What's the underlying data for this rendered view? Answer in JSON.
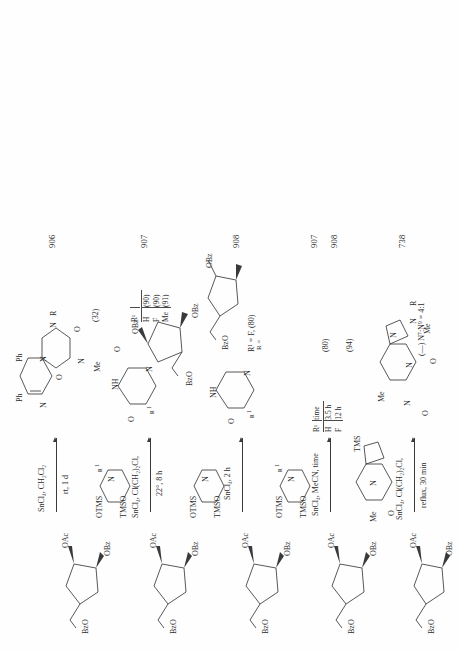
{
  "page": {
    "kind": "chemical-reaction-scheme",
    "orientation": "rotated-90-ccw",
    "background": "#fefefe",
    "ink": "#2b2b2b"
  },
  "rows": [
    {
      "id": "row-1",
      "substrate_label": "BzO — sugar — OAc (3,5-di-O-benzoyl-2-deoxyribofuranosyl acetate)",
      "reagent": "TMSO / Me-N pyrimido[4,5-b]pyrazine-2,4-dione, 6,7-diphenyl",
      "conditions_line1": "SnCl₄, CH₂Cl₂",
      "conditions_line2": "rt, 1 d",
      "yield": "(32)",
      "product_number": "906",
      "product_atoms": [
        "Ph",
        "Ph",
        "N",
        "N",
        "O",
        "O",
        "N",
        "N",
        "Me",
        "R"
      ]
    },
    {
      "id": "row-2",
      "substrate_label": "BzO — sugar — OAc",
      "reagent": "OTMS / TMSO pyrimidine with R¹",
      "conditions_line1": "SnCl₄, Cl(CH₂)₂Cl,",
      "conditions_line2": "22°, 8 h",
      "product_number": "907",
      "table": {
        "headers": [
          "R¹",
          ""
        ],
        "rows": [
          [
            "H",
            "(90)"
          ],
          [
            "F",
            "(90)"
          ],
          [
            "Me",
            "(91)"
          ]
        ]
      },
      "product_atoms": [
        "O",
        "NH",
        "O",
        "N",
        "R¹",
        "OBz",
        "OBz",
        "BzO"
      ]
    },
    {
      "id": "row-3",
      "substrate_label": "BzO — sugar — OAc",
      "reagent": "OTMS / TMSO pyrimidine",
      "conditions_line1": "SnCl₄, 2 h",
      "yield": "R¹ = F, (80)",
      "product_number": "908",
      "r_definition": "R =",
      "product_atoms": [
        "O",
        "NH",
        "O",
        "N",
        "R¹",
        "BzO",
        "OBz"
      ]
    },
    {
      "id": "row-4",
      "substrate_label": "BzO — sugar — OAc",
      "reagent": "OTMS / TMSO pyrimidine with R¹",
      "conditions_line1": "SnCl₄, MeCN, time",
      "table": {
        "headers": [
          "R¹",
          "time"
        ],
        "rows": [
          [
            "H",
            "3.5 h",
            "(80)"
          ],
          [
            "F",
            "12 h",
            "(94)"
          ]
        ]
      },
      "product_numbers": [
        "907",
        "908"
      ],
      "yields": [
        "(80)",
        "(94)"
      ]
    },
    {
      "id": "row-5",
      "substrate_label": "BzO — sugar — OAc",
      "reagent": "Me-N imidazo-fused purine-dione, TMS",
      "conditions_line1": "SnCl₄, Cl(CH₂)₂Cl,",
      "conditions_line2": "reflux, 30 min",
      "yield": "(—) N⁷:N⁹ = 4:1",
      "product_number": "738",
      "product_atoms": [
        "Me",
        "N",
        "N",
        "O",
        "O",
        "N",
        "Me",
        "R",
        "N",
        "N"
      ]
    },
    {
      "id": "row-6",
      "substrate_label": "BzO — sugar — OAc",
      "reagent": "OTMS / TMSO pyrimidine",
      "conditions_line1": "SnCl₄, MeCN,",
      "conditions_line2": "rt, 12 h",
      "yield": "(50)",
      "product_number": "364",
      "r_definition": "R =",
      "product_atoms": [
        "O",
        "NH",
        "N",
        "O",
        "BzO",
        "BzO"
      ]
    }
  ],
  "fragment_labels": {
    "bzo": "BzO",
    "obz": "OBz",
    "oac": "OAc",
    "otms": "OTMS",
    "tmso": "TMSO",
    "r_eq": "R =",
    "r1": "R¹",
    "nh": "NH",
    "n": "N",
    "o": "O",
    "me": "Me",
    "ph": "Ph",
    "tms": "TMS",
    "time": "time"
  }
}
